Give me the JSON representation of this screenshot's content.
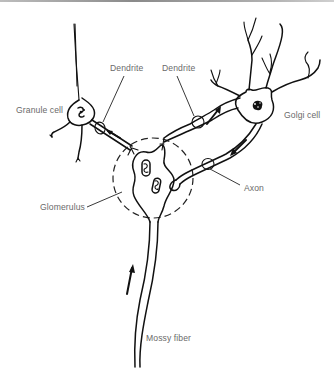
{
  "figure": {
    "type": "neuroanatomy-schematic",
    "labels": {
      "granule_cell": "Granule cell",
      "dendrite_left": "Dendrite",
      "dendrite_right": "Dendrite",
      "golgi_cell": "Golgi cell",
      "axon": "Axon",
      "glomerulus": "Glomerulus",
      "mossy_fiber": "Mossy fiber"
    },
    "arrows": [
      {
        "name": "granule-dendrite-arrow",
        "direction": "toward granule cell"
      },
      {
        "name": "golgi-dendrite-arrow",
        "direction": "toward golgi cell"
      },
      {
        "name": "golgi-axon-arrow",
        "direction": "toward glomerulus"
      },
      {
        "name": "mossy-fiber-arrow",
        "direction": "upward toward glomerulus"
      }
    ],
    "colors": {
      "ink": "#111111",
      "label_text": "#6a6a6a",
      "background": "#ffffff"
    }
  }
}
